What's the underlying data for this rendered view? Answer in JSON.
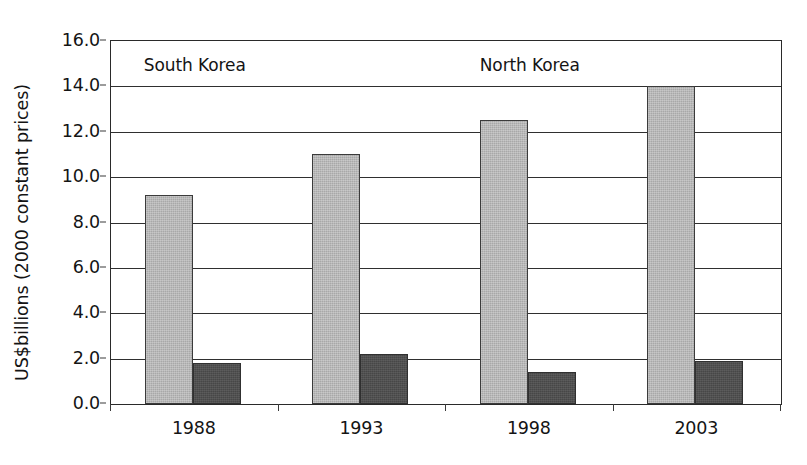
{
  "chart_data": {
    "type": "bar",
    "title": "",
    "subtitle": "",
    "xlabel": "",
    "ylabel": "US$billions (2000 constant prices)",
    "categories": [
      "1988",
      "1993",
      "1998",
      "2003"
    ],
    "series": [
      {
        "name": "South Korea",
        "color": "#a8a8a8",
        "values": [
          9.2,
          11.0,
          12.5,
          14.0
        ]
      },
      {
        "name": "North Korea",
        "color": "#474747",
        "values": [
          1.8,
          2.2,
          1.4,
          1.9
        ]
      }
    ],
    "ylim": [
      0.0,
      16.0
    ],
    "ytick_step": 2.0,
    "ytick_labels": [
      "0.0",
      "2.0",
      "4.0",
      "6.0",
      "8.0",
      "10.0",
      "12.0",
      "14.0",
      "16.0"
    ],
    "ytick_values": [
      0.0,
      2.0,
      4.0,
      6.0,
      8.0,
      10.0,
      12.0,
      14.0,
      16.0
    ],
    "grid": true,
    "grid_axis": "y",
    "legend": "none",
    "annotations": [
      {
        "text": "South Korea",
        "x_category_center": 0.5,
        "y_value": 14.9
      },
      {
        "text": "North Korea",
        "x_category_center": 2.5,
        "y_value": 14.9
      }
    ]
  },
  "colors": {
    "series_south": "#a8a8a8",
    "series_north": "#474747",
    "axis": "#2a2a2a",
    "gridline": "#2f2f2f",
    "text": "#141414",
    "background": "#ffffff"
  }
}
